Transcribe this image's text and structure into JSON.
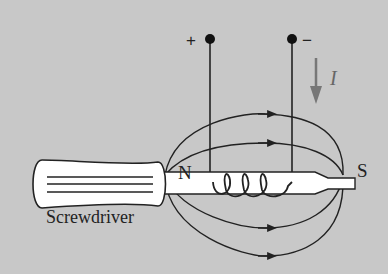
{
  "diagram": {
    "labels": {
      "north_pole": "N",
      "south_pole": "S",
      "object": "Screwdriver",
      "positive_terminal": "+",
      "negative_terminal": "−",
      "current": "I"
    },
    "elements": {
      "terminals": [
        "positive",
        "negative"
      ],
      "coil_turns": 4,
      "field_lines_above": 2,
      "field_lines_below": 2,
      "field_line_direction": "left-to-right (N to S outside)",
      "current_arrow_direction": "down"
    },
    "colors": {
      "background": "#c8c8c8",
      "ink": "#222222",
      "screwdriver_fill": "#ffffff",
      "current_arrow": "#777777"
    }
  }
}
